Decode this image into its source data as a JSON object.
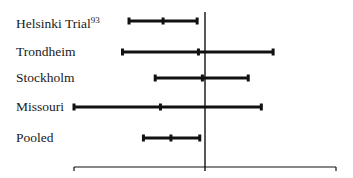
{
  "chart_data": {
    "type": "forest",
    "title": "",
    "xlabel": "",
    "ylabel": "",
    "grid": false,
    "legend": null,
    "reference_line_x": 0,
    "xlim": [
      -1,
      1
    ],
    "studies": [
      {
        "name": "Helsinki Trial",
        "superscript": "93",
        "lower": -0.58,
        "estimate": -0.32,
        "upper": -0.06
      },
      {
        "name": "Trondheim",
        "lower": -0.63,
        "estimate": -0.05,
        "upper": 0.52
      },
      {
        "name": "Stockholm",
        "lower": -0.38,
        "estimate": -0.02,
        "upper": 0.33
      },
      {
        "name": "Missouri",
        "lower": -1.0,
        "estimate": -0.34,
        "upper": 0.43
      },
      {
        "name": "Pooled",
        "lower": -0.47,
        "estimate": -0.26,
        "upper": -0.04
      }
    ]
  },
  "labels": {
    "helsinki": "Helsinki Trial",
    "helsinki_sup": "93",
    "trondheim": "Trondheim",
    "stockholm": "Stockholm",
    "missouri": "Missouri",
    "pooled": "Pooled"
  }
}
